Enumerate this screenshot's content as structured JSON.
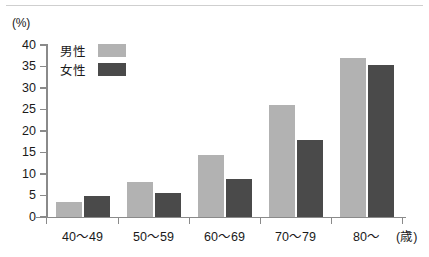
{
  "chart_data": {
    "type": "bar",
    "title": "",
    "xlabel": "(歳)",
    "ylabel": "(%)",
    "categories": [
      "40～49",
      "50～59",
      "60～69",
      "70～79",
      "80～"
    ],
    "series": [
      {
        "name": "男性",
        "color": "#b2b2b2",
        "values": [
          3.5,
          8.2,
          14.5,
          26.0,
          37.0
        ]
      },
      {
        "name": "女性",
        "color": "#4a4a4a",
        "values": [
          5.0,
          5.5,
          8.8,
          18.0,
          35.3
        ]
      }
    ],
    "ylim": [
      0,
      40
    ],
    "yticks": [
      0,
      5,
      10,
      15,
      20,
      25,
      30,
      35,
      40
    ],
    "ytick_labels": [
      "0",
      "5",
      "10",
      "15",
      "20",
      "25",
      "30",
      "35",
      "40"
    ],
    "grid": false,
    "legend_position": "top-left"
  },
  "axes": {
    "y_unit_label": "(%)",
    "x_unit_label": "(歳)"
  },
  "legend": {
    "items": [
      {
        "label": "男性",
        "color": "#b2b2b2"
      },
      {
        "label": "女性",
        "color": "#4a4a4a"
      }
    ]
  },
  "colors": {
    "male": "#b2b2b2",
    "female": "#4a4a4a",
    "axis": "#8a8a8a",
    "text": "#1a1a1a",
    "top_rule": "#cfcfcf",
    "background": "#ffffff"
  }
}
